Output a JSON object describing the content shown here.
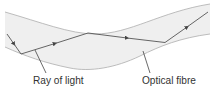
{
  "diagram": {
    "labels": {
      "ray": "Ray of light",
      "fibre": "Optical fibre"
    },
    "colors": {
      "fibre_fill": "#efefef",
      "fibre_edge": "#b5b5b5",
      "ray": "#555555",
      "leader": "#444444",
      "text": "#333333"
    }
  }
}
